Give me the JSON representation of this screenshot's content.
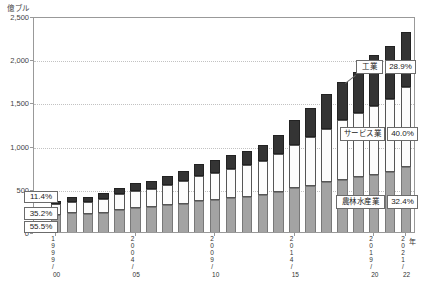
{
  "unit_label": "億ブル",
  "left_callouts": {
    "industry_pct": "11.4%",
    "services_pct": "35.2%",
    "agriculture_pct": "55.5%"
  },
  "right_labels": {
    "industry": {
      "name": "工業",
      "pct": "28.9%"
    },
    "services": {
      "name": "サービス業",
      "pct": "40.0%"
    },
    "agriculture": {
      "name": "農林水産業",
      "pct": "32.4%"
    }
  },
  "chart_data": {
    "type": "bar",
    "stacked": true,
    "title": "",
    "xlabel": "",
    "ylabel": "億ブル",
    "ylim": [
      0,
      2500
    ],
    "grid": "horizontal-dotted",
    "legend_position": "callout-boxes-on-plot",
    "categories": [
      "1999/00",
      "2000/01",
      "2001/02",
      "2002/03",
      "2003/04",
      "2004/05",
      "2005/06",
      "2006/07",
      "2007/08",
      "2008/09",
      "2009/10",
      "2010/11",
      "2011/12",
      "2012/13",
      "2013/14",
      "2014/15",
      "2015/16",
      "2016/17",
      "2017/18",
      "2018/19",
      "2019/20",
      "2020/21",
      "2021/22"
    ],
    "series": [
      {
        "name": "農林水産業",
        "color": "#a3a3a3",
        "values": [
          195,
          215,
          210,
          225,
          255,
          280,
          290,
          310,
          330,
          360,
          375,
          395,
          410,
          430,
          460,
          510,
          535,
          575,
          605,
          635,
          655,
          690,
          750
        ]
      },
      {
        "name": "サービス業",
        "color": "#fcfcfc",
        "values": [
          124,
          137,
          140,
          155,
          180,
          195,
          210,
          230,
          255,
          290,
          310,
          335,
          360,
          395,
          440,
          500,
          560,
          620,
          690,
          740,
          800,
          850,
          925
        ]
      },
      {
        "name": "工業",
        "color": "#343434",
        "values": [
          41,
          48,
          55,
          70,
          80,
          90,
          95,
          110,
          125,
          140,
          150,
          160,
          170,
          185,
          220,
          290,
          340,
          400,
          445,
          480,
          590,
          615,
          640
        ]
      }
    ],
    "annotations": {
      "1999/00": {
        "工業": "11.4%",
        "サービス業": "35.2%",
        "農林水産業": "55.5%"
      },
      "2021/22": {
        "工業": "28.9%",
        "サービス業": "40.0%",
        "農林水産業": "32.4%"
      }
    },
    "y_ticks": [
      {
        "v": 0,
        "label": "0"
      },
      {
        "v": 500,
        "label": "500"
      },
      {
        "v": 1000,
        "label": "1,000"
      },
      {
        "v": 1500,
        "label": "1,500"
      },
      {
        "v": 2000,
        "label": "2,000"
      },
      {
        "v": 2500,
        "label": "2,500"
      }
    ],
    "x_ticks": [
      {
        "bar_index": 0,
        "year": "1999",
        "short": "00",
        "suffix": ""
      },
      {
        "bar_index": 5,
        "year": "2004",
        "short": "05",
        "suffix": ""
      },
      {
        "bar_index": 10,
        "year": "2009",
        "short": "10",
        "suffix": ""
      },
      {
        "bar_index": 15,
        "year": "2014",
        "short": "15",
        "suffix": ""
      },
      {
        "bar_index": 20,
        "year": "2019",
        "short": "20",
        "suffix": ""
      },
      {
        "bar_index": 22,
        "year": "2021",
        "short": "22",
        "suffix": "年"
      }
    ]
  }
}
